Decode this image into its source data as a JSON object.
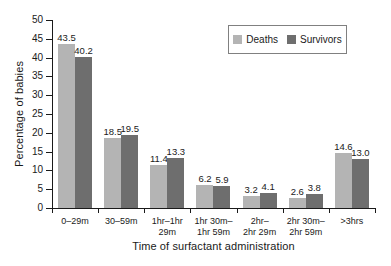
{
  "chart_data": {
    "type": "bar",
    "title": "",
    "xlabel": "Time of surfactant administration",
    "ylabel": "Percentage of babies",
    "ylim": [
      0,
      50
    ],
    "ytick_step": 5,
    "yticks": [
      "0",
      "5",
      "10",
      "15",
      "20",
      "25",
      "30",
      "35",
      "40",
      "45",
      "50"
    ],
    "grid": false,
    "legend_position": "top-right",
    "categories": [
      "0–29m",
      "30–59m",
      "1hr–1hr 29m",
      "1hr 30m–\n1hr 59m",
      "2hr–\n2hr 29m",
      "2hr 30m–\n2hr 59m",
      ">3hrs"
    ],
    "series": [
      {
        "name": "Deaths",
        "color": "#b4b4b4",
        "values": [
          43.5,
          18.5,
          11.4,
          6.2,
          3.2,
          2.6,
          14.6
        ],
        "labels": [
          "43.5",
          "18.5",
          "11.4",
          "6.2",
          "3.2",
          "2.6",
          "14.6"
        ]
      },
      {
        "name": "Survivors",
        "color": "#6e6e6e",
        "values": [
          40.2,
          19.5,
          13.3,
          5.9,
          4.1,
          3.8,
          13.0
        ],
        "labels": [
          "40.2",
          "19.5",
          "13.3",
          "5.9",
          "4.1",
          "3.8",
          "13.0"
        ]
      }
    ]
  },
  "legend": {
    "entries": [
      {
        "label": "Deaths",
        "color": "#b4b4b4"
      },
      {
        "label": "Survivors",
        "color": "#6e6e6e"
      }
    ]
  },
  "axes": {
    "y_title": "Percentage of babies",
    "x_title": "Time of surfactant administration"
  }
}
